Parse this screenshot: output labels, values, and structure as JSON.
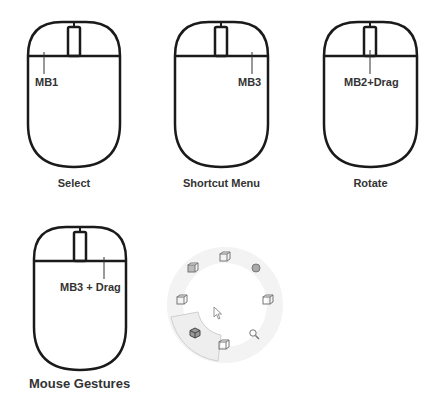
{
  "diagram": {
    "panels": [
      {
        "id": "select",
        "button_label": "MB1",
        "caption": "Select",
        "pointer_target": "left-button"
      },
      {
        "id": "shortcut-menu",
        "button_label": "MB3",
        "caption": "Shortcut Menu",
        "pointer_target": "right-button"
      },
      {
        "id": "rotate",
        "button_label": "MB2+Drag",
        "caption": "Rotate",
        "pointer_target": "middle-wheel"
      },
      {
        "id": "mouse-gestures",
        "button_label": "MB3 + Drag",
        "caption": "Mouse Gestures",
        "pointer_target": "right-button"
      }
    ],
    "gesture_menu": {
      "item_count": 8,
      "highlighted_index": 5,
      "items": [
        {
          "position": "top",
          "icon": "view-cube-icon"
        },
        {
          "position": "top-right",
          "icon": "shaded-sphere-icon"
        },
        {
          "position": "right",
          "icon": "view-cube-icon"
        },
        {
          "position": "bottom-right",
          "icon": "zoom-icon"
        },
        {
          "position": "bottom",
          "icon": "view-cube-icon"
        },
        {
          "position": "bottom-left",
          "icon": "isometric-cube-icon"
        },
        {
          "position": "left",
          "icon": "view-cube-icon"
        },
        {
          "position": "top-left",
          "icon": "shaded-cube-icon"
        }
      ],
      "center_icon": "cursor-arrow-icon"
    },
    "colors": {
      "outline": "#1a1a1a",
      "text": "#333333",
      "ring": "#f0f0f0",
      "highlight_fill": "#eeeeee",
      "highlight_stroke": "#cfcfcf",
      "icon": "#777777"
    }
  }
}
